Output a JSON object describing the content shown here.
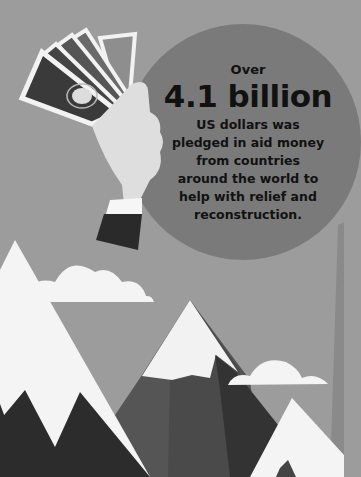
{
  "infographic": {
    "callout": {
      "prefix": "Over",
      "figure": "4.1 billion",
      "lines": [
        "US dollars was",
        "pledged in aid money",
        "from countries",
        "around the world to",
        "help with relief and",
        "reconstruction."
      ]
    },
    "illustration": {
      "elements": [
        "hand-holding-banknotes",
        "clouds",
        "snow-capped-mountains"
      ]
    },
    "colors": {
      "background": "#9c9c9c",
      "circle": "#7a7a7a",
      "text": "#111111",
      "snow": "#f4f4f4",
      "mountain_dark": "#2e2e2e",
      "mountain_mid": "#555555"
    }
  }
}
